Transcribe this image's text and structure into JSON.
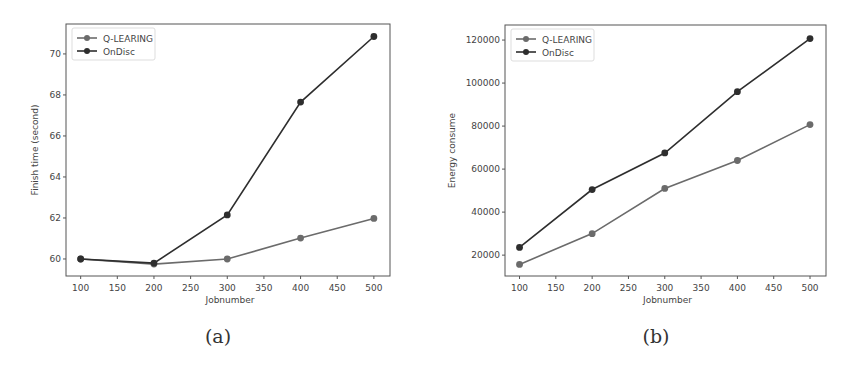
{
  "figure": {
    "panels": [
      {
        "caption": "(a)"
      },
      {
        "caption": "(b)"
      }
    ]
  },
  "chart_data": [
    {
      "type": "line",
      "title": "",
      "caption": "(a)",
      "xlabel": "Jobnumber",
      "ylabel": "Finish time (second)",
      "x": [
        100,
        200,
        300,
        400,
        500
      ],
      "xticks": [
        100,
        150,
        200,
        250,
        300,
        350,
        400,
        450,
        500
      ],
      "yticks": [
        60,
        62,
        64,
        66,
        68,
        70
      ],
      "xlim": [
        80,
        522
      ],
      "ylim": [
        59.17,
        71.46
      ],
      "grid": false,
      "legend_position": "upper left",
      "series": [
        {
          "name": "Q-LEARING",
          "color": "#6b6b6b",
          "marker": "circle",
          "values": [
            60.0,
            59.75,
            60.0,
            61.02,
            61.98
          ]
        },
        {
          "name": "OnDisc",
          "color": "#2e2e2e",
          "marker": "circle",
          "values": [
            60.0,
            59.8,
            62.15,
            67.65,
            70.85
          ]
        }
      ]
    },
    {
      "type": "line",
      "title": "",
      "caption": "(b)",
      "xlabel": "Jobnumber",
      "ylabel": "Energy consume",
      "x": [
        100,
        200,
        300,
        400,
        500
      ],
      "xticks": [
        100,
        150,
        200,
        250,
        300,
        350,
        400,
        450,
        500
      ],
      "yticks": [
        20000,
        40000,
        60000,
        80000,
        100000,
        120000
      ],
      "xlim": [
        80,
        522
      ],
      "ylim": [
        10300,
        127000
      ],
      "grid": false,
      "legend_position": "upper left",
      "series": [
        {
          "name": "Q-LEARING",
          "color": "#6b6b6b",
          "marker": "circle",
          "values": [
            15700,
            30000,
            51000,
            64000,
            80700
          ]
        },
        {
          "name": "OnDisc",
          "color": "#2e2e2e",
          "marker": "circle",
          "values": [
            23600,
            50500,
            67500,
            96000,
            120700
          ]
        }
      ]
    }
  ]
}
